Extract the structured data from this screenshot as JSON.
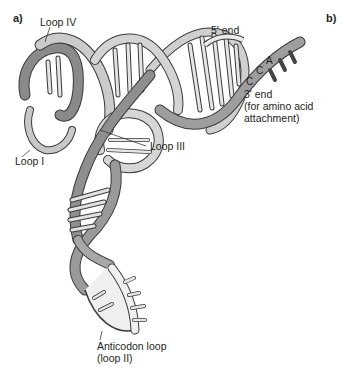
{
  "figure": {
    "panel_a_label": "a)",
    "panel_b_label": "b)"
  },
  "labels": {
    "loop_iv": "Loop IV",
    "loop_i": "Loop I",
    "loop_iii": "Loop III",
    "five_prime_end": "5' end",
    "three_prime_end": "3' end",
    "three_prime_note_line1": "(for amino acid",
    "three_prime_note_line2": "attachment)",
    "anticodon_line1": "Anticodon loop",
    "anticodon_line2": "(loop II)"
  },
  "bases": {
    "base1": "C",
    "base2": "C",
    "base3": "A"
  },
  "colors": {
    "ribbon_light": "#d4d4d4",
    "ribbon_mid": "#a8a8a8",
    "ribbon_dark": "#7d7d7d",
    "ribbon_pale": "#ececec",
    "outline": "#3a3a3a",
    "base_pair": "#d9d9d9",
    "stub_dark": "#555555",
    "text": "#231f20",
    "background": "#ffffff"
  }
}
